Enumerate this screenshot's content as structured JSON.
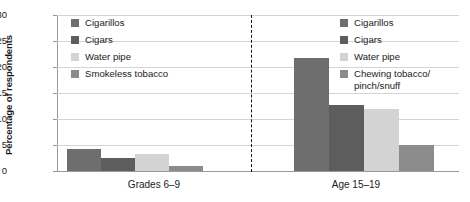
{
  "chart_data": {
    "type": "bar",
    "title": "",
    "xlabel": "",
    "ylabel": "Percentage of respondents",
    "ylim": [
      0,
      30
    ],
    "yticks": [
      "0",
      "5",
      "10",
      "15",
      "20",
      "25",
      "30"
    ],
    "grid": true,
    "legend_position": "inside-top-left and inside-top-right",
    "categories": [
      "Grades 6–9",
      "Age 15–19"
    ],
    "series": [
      {
        "name": "Cigarillos",
        "values": [
          4.2,
          21.8
        ],
        "color": "#6e6e6e"
      },
      {
        "name": "Cigars",
        "values": [
          2.5,
          12.6
        ],
        "color": "#5d5d5d"
      },
      {
        "name": "Water pipe",
        "values": [
          3.3,
          12.0
        ],
        "color": "#d3d3d3"
      },
      {
        "name": "Smokeless tobacco",
        "values": [
          1.0,
          null
        ],
        "color": "#8c8c8c"
      },
      {
        "name": "Chewing tobacco/\npinch/snuff",
        "values": [
          null,
          5.0
        ],
        "color": "#8c8c8c"
      }
    ]
  },
  "axis": {
    "y_title": "Percentage of respondents",
    "y_tick_labels": [
      "30",
      "25",
      "20",
      "15",
      "10",
      "5",
      "0"
    ],
    "group_labels": [
      "Grades 6–9",
      "Age 15–19"
    ]
  },
  "legend_left": {
    "items": [
      {
        "label": "Cigarillos",
        "color": "#6e6e6e"
      },
      {
        "label": "Cigars",
        "color": "#5d5d5d"
      },
      {
        "label": "Water pipe",
        "color": "#d3d3d3"
      },
      {
        "label": "Smokeless tobacco",
        "color": "#8c8c8c"
      }
    ]
  },
  "legend_right": {
    "items": [
      {
        "label": "Cigarillos",
        "color": "#6e6e6e"
      },
      {
        "label": "Cigars",
        "color": "#5d5d5d"
      },
      {
        "label": "Water pipe",
        "color": "#d3d3d3"
      },
      {
        "label": "Chewing tobacco/\npinch/snuff",
        "color": "#8c8c8c"
      }
    ]
  },
  "colors": {
    "gridline": "#d4d4d4",
    "axis": "#9a9a9a",
    "divider": "#111111",
    "text": "#1a1a1a",
    "background": "#ffffff"
  }
}
